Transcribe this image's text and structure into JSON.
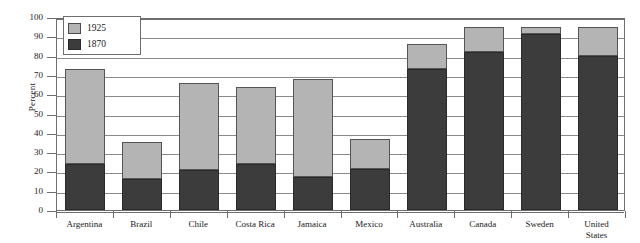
{
  "chart_data": {
    "type": "bar",
    "stacked": true,
    "title": "",
    "subtitle": "",
    "xlabel": "",
    "ylabel": "Percent",
    "ylim": [
      0,
      100
    ],
    "ytick_step": 10,
    "yticks": [
      100,
      90,
      80,
      70,
      60,
      50,
      40,
      30,
      20,
      10,
      0
    ],
    "grid": true,
    "legend_position": "top-left",
    "categories": [
      "Argentina",
      "Brazil",
      "Chile",
      "Costa Rica",
      "Jamaica",
      "Mexico",
      "Australia",
      "Canada",
      "Sweden",
      "United States"
    ],
    "category_labels_multiline": [
      "Argentina",
      "Brazil",
      "Chile",
      "Costa Rica",
      "Jamaica",
      "Mexico",
      "Australia",
      "Canada",
      "Sweden",
      "United\nStates"
    ],
    "series": [
      {
        "name": "1870",
        "color": "#3c3c3c",
        "values": [
          24,
          16,
          20.5,
          24,
          17,
          21,
          73,
          82,
          91,
          80
        ]
      },
      {
        "name": "1925",
        "color": "#b4b4b4",
        "values": [
          49,
          19,
          45.5,
          40,
          51,
          16,
          13,
          13,
          4,
          15
        ]
      }
    ],
    "totals": [
      73,
      35,
      66,
      64,
      68,
      37,
      86,
      95,
      95,
      95
    ]
  },
  "legend": {
    "items": [
      {
        "label": "1925",
        "swatch": "light"
      },
      {
        "label": "1870",
        "swatch": "dark"
      }
    ]
  },
  "colors": {
    "light_gray": "#b4b4b4",
    "dark_gray": "#3c3c3c",
    "gridline": "#8a8a8a",
    "axis": "#6e6e6e",
    "background": "#ffffff"
  }
}
